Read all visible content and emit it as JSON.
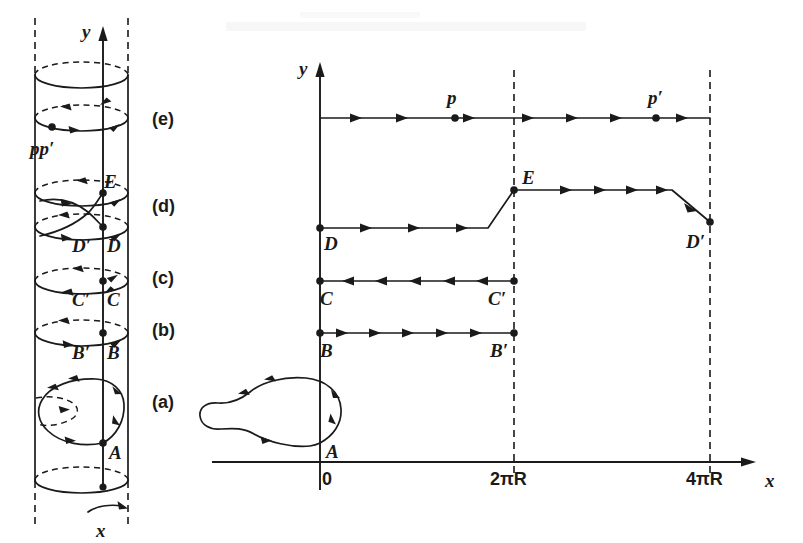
{
  "figure": {
    "title_visible": false,
    "background_color": "#ffffff",
    "ink_color": "#1a1a1a"
  },
  "left_panel": {
    "name": "cylinder-view",
    "axis_labels": {
      "vertical": "y",
      "circumferential": "x"
    },
    "stage_labels": [
      {
        "key": "a",
        "text": "(a)",
        "x": 160,
        "y": 401
      },
      {
        "key": "b",
        "text": "(b)",
        "x": 160,
        "y": 327
      },
      {
        "key": "c",
        "text": "(c)",
        "x": 160,
        "y": 276
      },
      {
        "key": "d",
        "text": "(d)",
        "x": 160,
        "y": 206
      },
      {
        "key": "e",
        "text": "(e)",
        "x": 160,
        "y": 124
      }
    ],
    "point_labels": [
      {
        "text": "A",
        "x": 110,
        "y": 456
      },
      {
        "text": "B′",
        "x": 76,
        "y": 359
      },
      {
        "text": "B",
        "x": 108,
        "y": 359
      },
      {
        "text": "C′",
        "x": 76,
        "y": 306
      },
      {
        "text": "C",
        "x": 108,
        "y": 306
      },
      {
        "text": "D′",
        "x": 76,
        "y": 251
      },
      {
        "text": "D",
        "x": 108,
        "y": 251
      },
      {
        "text": "E",
        "x": 108,
        "y": 188
      },
      {
        "text": "pp′",
        "x": 40,
        "y": 155
      }
    ],
    "geometry": {
      "cylinder_left_x": 35,
      "cylinder_right_x": 128,
      "axis_x": 103,
      "top_cap_y": 75,
      "bottom_cap_y": 480,
      "ellipse_rx": 46.5,
      "ellipse_ry": 13,
      "loop_levels": {
        "e": 118,
        "d_upper": 193,
        "d_lower": 227,
        "c": 281,
        "b": 333,
        "a_center": 405
      }
    }
  },
  "right_panel": {
    "name": "unrolled-plane-view",
    "axis_labels": {
      "vertical": "y",
      "horizontal": "x"
    },
    "x_ticks": [
      {
        "label": "0",
        "value": 0,
        "x": 320
      },
      {
        "label": "2πR",
        "value": 514,
        "x": 514
      },
      {
        "label": "4πR",
        "value": 710,
        "x": 710
      }
    ],
    "point_labels": [
      {
        "text": "p",
        "x": 449,
        "y": 104
      },
      {
        "text": "p′",
        "x": 650,
        "y": 104
      },
      {
        "text": "E",
        "x": 526,
        "y": 184
      },
      {
        "text": "D",
        "x": 325,
        "y": 250
      },
      {
        "text": "D′",
        "x": 694,
        "y": 248
      },
      {
        "text": "C",
        "x": 322,
        "y": 305
      },
      {
        "text": "C′",
        "x": 493,
        "y": 305
      },
      {
        "text": "B",
        "x": 322,
        "y": 357
      },
      {
        "text": "B′",
        "x": 495,
        "y": 357
      },
      {
        "text": "A",
        "x": 331,
        "y": 457
      }
    ],
    "geometry": {
      "y_axis_x": 320,
      "x_axis_y": 462,
      "y_axis_top": 62,
      "y_axis_bottom": 490,
      "x_axis_left": 212,
      "x_axis_right": 752,
      "dashed_x_positions": [
        514,
        710
      ],
      "dashed_y_top": 70,
      "dashed_y_bottom": 478
    },
    "paths": [
      {
        "name": "pp-prime-line",
        "label_start": "p",
        "label_end": "p′",
        "y": 118,
        "x_start": 320,
        "x_end": 710,
        "direction": "right",
        "dot_positions": [
          455,
          656
        ]
      },
      {
        "name": "D-to-E-to-Dprime-path",
        "label_start": "D",
        "label_mid": "E",
        "label_end": "D′",
        "direction": "right",
        "vertices": [
          [
            320,
            228
          ],
          [
            488,
            228
          ],
          [
            514,
            190
          ],
          [
            672,
            190
          ],
          [
            710,
            222
          ]
        ]
      },
      {
        "name": "C-to-Cprime-line",
        "label_start": "C",
        "label_end": "C′",
        "y": 281,
        "x_start": 320,
        "x_end": 514,
        "direction": "left"
      },
      {
        "name": "B-to-Bprime-line",
        "label_start": "B",
        "label_end": "B′",
        "y": 333,
        "x_start": 320,
        "x_end": 514,
        "direction": "right"
      },
      {
        "name": "A-teardrop-loop",
        "label": "A",
        "anchor": [
          320,
          443
        ],
        "direction": "counterclockwise"
      }
    ]
  }
}
